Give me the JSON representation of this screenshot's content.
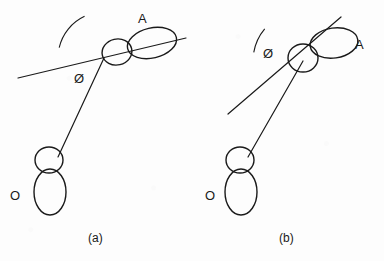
{
  "figure": {
    "width": 384,
    "height": 261,
    "background_color": "#fdfdfd",
    "stroke_color": "#1a1a1a",
    "text_color": "#1a1a1a"
  },
  "panels": [
    {
      "id": "a",
      "caption": "(a)",
      "caption_x": 88,
      "caption_y": 232,
      "angle_symbol": "Ø",
      "angle_symbol_x": 74,
      "angle_symbol_y": 72,
      "acceptor_label": "A",
      "acceptor_label_x": 138,
      "acceptor_label_y": 12,
      "donor_label": "O",
      "donor_label_x": 10,
      "donor_label_y": 189,
      "reference_line": {
        "x1": 18,
        "y1": 78,
        "x2": 186,
        "y2": 38
      },
      "bond_line": {
        "x1": 104,
        "y1": 58,
        "x2": 58,
        "y2": 157
      },
      "angle_arc": {
        "cx": 104,
        "cy": 58,
        "r": 46,
        "start_deg": 193,
        "end_deg": 245
      },
      "acceptor_small_lobe": {
        "cx": 117,
        "cy": 52,
        "rx": 15,
        "ry": 13,
        "rotate": -13
      },
      "acceptor_large_lobe": {
        "cx": 152,
        "cy": 43,
        "rx": 25,
        "ry": 15,
        "rotate": -13
      },
      "donor_small_lobe": {
        "cx": 49,
        "cy": 160,
        "rx": 14,
        "ry": 13,
        "rotate": 0
      },
      "donor_large_lobe": {
        "cx": 50,
        "cy": 192,
        "rx": 16,
        "ry": 23,
        "rotate": 0
      }
    },
    {
      "id": "b",
      "caption": "(b)",
      "caption_x": 279,
      "caption_y": 232,
      "angle_symbol": "Ø",
      "angle_symbol_x": 263,
      "angle_symbol_y": 47,
      "acceptor_label": "A",
      "acceptor_label_x": 355,
      "acceptor_label_y": 38,
      "donor_label": "O",
      "donor_label_x": 205,
      "donor_label_y": 189,
      "reference_line": {
        "x1": 228,
        "y1": 114,
        "x2": 341,
        "y2": 17
      },
      "bond_line": {
        "x1": 303,
        "y1": 61,
        "x2": 248,
        "y2": 157
      },
      "angle_arc": {
        "cx": 303,
        "cy": 61,
        "r": 50,
        "start_deg": 190,
        "end_deg": 220
      },
      "acceptor_small_lobe": {
        "cx": 303,
        "cy": 58,
        "rx": 15,
        "ry": 14,
        "rotate": 0
      },
      "acceptor_large_lobe": {
        "cx": 334,
        "cy": 43,
        "rx": 24,
        "ry": 15,
        "rotate": -8
      },
      "donor_small_lobe": {
        "cx": 240,
        "cy": 160,
        "rx": 14,
        "ry": 13,
        "rotate": 0
      },
      "donor_large_lobe": {
        "cx": 241,
        "cy": 192,
        "rx": 16,
        "ry": 23,
        "rotate": 0
      }
    }
  ]
}
